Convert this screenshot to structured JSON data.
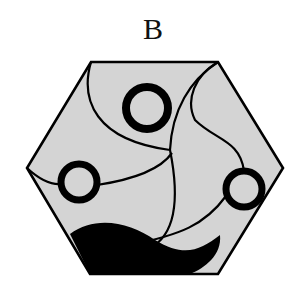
{
  "figure": {
    "label": "B",
    "shape": "hexagon",
    "colors": {
      "fill": "#d4d4d4",
      "stroke": "#000000",
      "background": "#ffffff"
    },
    "hexagon_points": "91,62 218,62 283,168 218,274 90,274 27,168",
    "rings": [
      {
        "name": "top-ring",
        "cx": 147,
        "cy": 108,
        "r": 21,
        "stroke_width": 8
      },
      {
        "name": "left-ring",
        "cx": 79,
        "cy": 182,
        "r": 18,
        "stroke_width": 7
      },
      {
        "name": "right-ring",
        "cx": 244,
        "cy": 189,
        "r": 18,
        "stroke_width": 7
      }
    ],
    "curves": [
      "M91,62 C80,100 95,140 170,150",
      "M218,62 C190,80 172,110 170,150",
      "M218,62 C195,75 185,100 195,120 C215,140 240,140 244,171",
      "M27,168 C40,180 50,185 61,184",
      "M97,185 C130,180 160,170 172,153",
      "M170,150 C180,200 175,235 150,248",
      "M226,196 C205,225 180,235 130,245"
    ],
    "blob_path": "M70,234 C95,215 130,222 155,240 C185,258 200,250 220,235 C222,255 205,268 190,274 L90,274 Z"
  }
}
